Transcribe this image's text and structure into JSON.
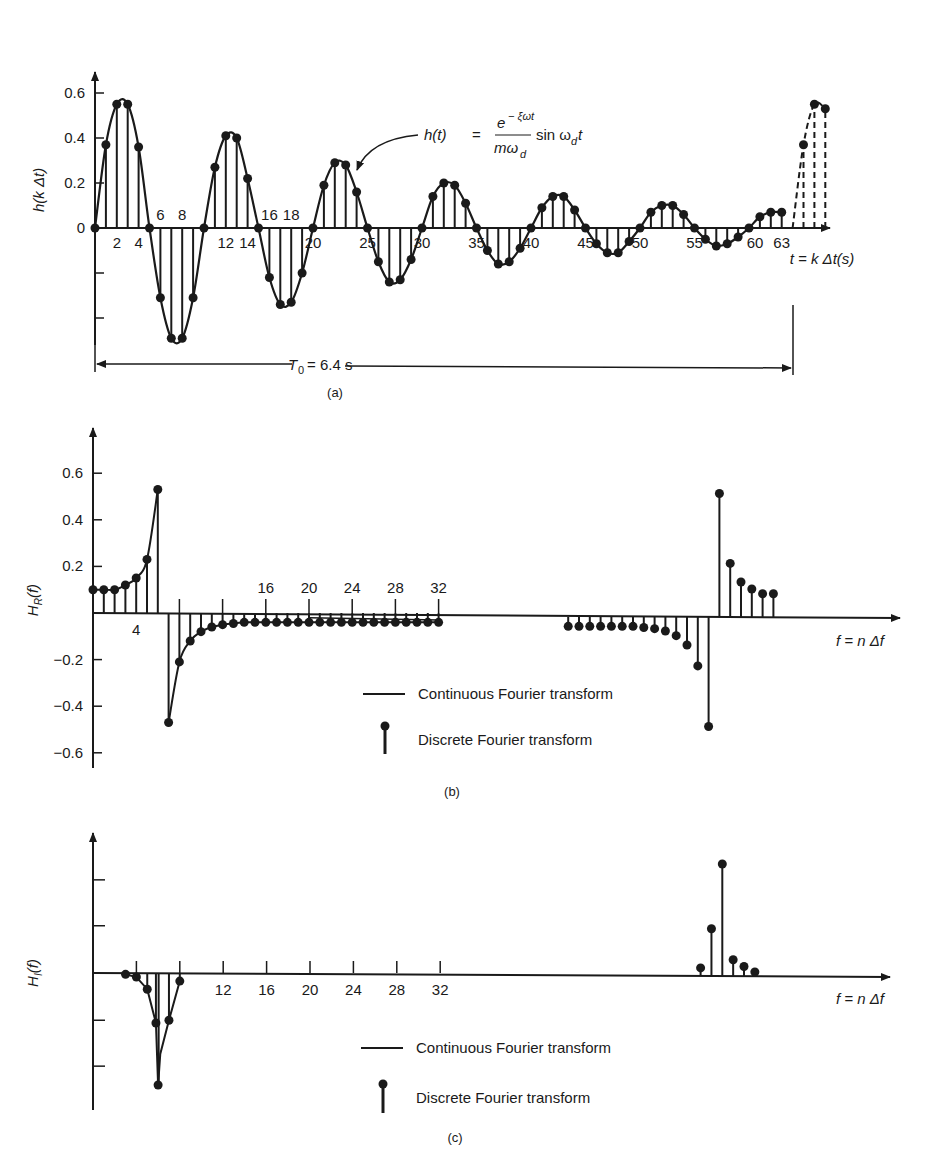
{
  "chart_data": [
    {
      "panel": "a",
      "type": "stem",
      "caption": "(a)",
      "title": "",
      "xlabel": "t = k Δt(s)",
      "ylabel": "h(k Δt)",
      "y_ticks": [
        "0.6",
        "0.4",
        "0.2",
        "0"
      ],
      "x_tick_labels_above": [
        "6",
        "8",
        "16",
        "18"
      ],
      "x_tick_labels_below": [
        "2",
        "4",
        "12",
        "14",
        "20",
        "25",
        "30",
        "35",
        "40",
        "45",
        "50",
        "55",
        "60",
        "63"
      ],
      "equation": {
        "lhs": "h(t)",
        "eq": "=",
        "numerator": "e⁻ᶟωt",
        "num_exp": "− ξωt",
        "num_base": "e",
        "denominator": "mω",
        "den_sub": "d",
        "rhs": "sin ω",
        "rhs_sub": "d",
        "rhs_t": "t"
      },
      "period_annotation": {
        "label": "T",
        "sub": "0",
        "value": "= 6.4 s"
      },
      "ylim": [
        -0.6,
        0.7
      ],
      "k": [
        0,
        1,
        2,
        3,
        4,
        5,
        6,
        7,
        8,
        9,
        10,
        11,
        12,
        13,
        14,
        15,
        16,
        17,
        18,
        19,
        20,
        21,
        22,
        23,
        24,
        25,
        26,
        27,
        28,
        29,
        30,
        31,
        32,
        33,
        34,
        35,
        36,
        37,
        38,
        39,
        40,
        41,
        42,
        43,
        44,
        45,
        46,
        47,
        48,
        49,
        50,
        51,
        52,
        53,
        54,
        55,
        56,
        57,
        58,
        59,
        60,
        61,
        62,
        63
      ],
      "values": [
        0,
        0.37,
        0.55,
        0.55,
        0.36,
        0,
        -0.31,
        -0.49,
        -0.49,
        -0.31,
        0,
        0.27,
        0.41,
        0.4,
        0.22,
        0,
        -0.22,
        -0.34,
        -0.33,
        -0.2,
        0,
        0.19,
        0.29,
        0.28,
        0.16,
        0,
        -0.15,
        -0.24,
        -0.23,
        -0.14,
        0,
        0.14,
        0.2,
        0.19,
        0.11,
        0,
        -0.1,
        -0.16,
        -0.15,
        -0.09,
        0,
        0.09,
        0.14,
        0.14,
        0.08,
        0,
        -0.07,
        -0.11,
        -0.11,
        -0.06,
        0,
        0.07,
        0.1,
        0.1,
        0.06,
        0,
        -0.05,
        -0.08,
        -0.07,
        -0.04,
        0,
        0.05,
        0.07,
        0.07
      ],
      "periodic_extension": {
        "k": [
          64,
          65,
          66,
          67
        ],
        "values": [
          0,
          0.37,
          0.55,
          0.53
        ],
        "style": "dashed"
      }
    },
    {
      "panel": "b",
      "type": "stem",
      "caption": "(b)",
      "xlabel": "f = n Δf",
      "ylabel": "H_R(f)",
      "ylabel_main": "H",
      "ylabel_sub": "R",
      "ylabel_tail": "(f)",
      "y_ticks": [
        "0.6",
        "0.4",
        "0.2",
        "−0.2",
        "−0.4",
        "−0.6"
      ],
      "x_tick_labels": [
        "4",
        "16",
        "20",
        "24",
        "28",
        "32"
      ],
      "ylim": [
        -0.6,
        0.7
      ],
      "n": [
        0,
        1,
        2,
        3,
        4,
        5,
        6,
        7,
        8,
        9,
        10,
        11,
        12,
        13,
        14,
        15,
        16,
        17,
        18,
        19,
        20,
        21,
        22,
        23,
        24,
        25,
        26,
        27,
        28,
        29,
        30,
        31,
        32
      ],
      "values": [
        0.1,
        0.1,
        0.1,
        0.12,
        0.15,
        0.23,
        0.53,
        -0.47,
        -0.21,
        -0.12,
        -0.08,
        -0.06,
        -0.05,
        -0.045,
        -0.04,
        -0.04,
        -0.04,
        -0.04,
        -0.04,
        -0.04,
        -0.04,
        -0.04,
        -0.04,
        -0.04,
        -0.04,
        -0.04,
        -0.04,
        -0.04,
        -0.04,
        -0.04,
        -0.04,
        -0.04,
        -0.04
      ],
      "mirror_n": [
        44,
        45,
        46,
        47,
        48,
        49,
        50,
        51,
        52,
        53,
        54,
        55,
        56,
        57,
        58,
        59,
        60,
        61,
        62,
        63
      ],
      "mirror_values": [
        -0.04,
        -0.04,
        -0.04,
        -0.04,
        -0.04,
        -0.04,
        -0.04,
        -0.045,
        -0.05,
        -0.06,
        -0.08,
        -0.12,
        -0.21,
        -0.47,
        0.53,
        0.23,
        0.15,
        0.12,
        0.1,
        0.1
      ],
      "legend": [
        {
          "symbol": "line",
          "label": "Continuous Fourier transform"
        },
        {
          "symbol": "stem",
          "label": "Discrete Fourier transform"
        }
      ]
    },
    {
      "panel": "c",
      "type": "stem",
      "caption": "(c)",
      "xlabel": "f = n Δf",
      "ylabel": "H_I(f)",
      "ylabel_main": "H",
      "ylabel_sub": "I",
      "ylabel_tail": "(f)",
      "x_tick_labels": [
        "12",
        "16",
        "20",
        "24",
        "28",
        "32"
      ],
      "n": [
        3,
        4,
        5,
        6,
        7,
        8
      ],
      "values": [
        -0.01,
        -0.03,
        -0.12,
        -0.37,
        -0.35,
        -0.06
      ],
      "trough": {
        "n": 6,
        "value": -0.83
      },
      "mirror_n": [
        56,
        57,
        58,
        59,
        60,
        61
      ],
      "mirror_values": [
        0.06,
        0.35,
        0.83,
        0.12,
        0.07,
        0.03
      ],
      "legend": [
        {
          "symbol": "line",
          "label": "Continuous Fourier transform"
        },
        {
          "symbol": "stem",
          "label": "Discrete Fourier transform"
        }
      ]
    }
  ],
  "style": {
    "ink": "#1a1a1a",
    "background": "#ffffff"
  }
}
